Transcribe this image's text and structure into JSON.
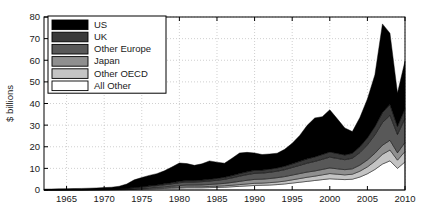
{
  "chart_data": {
    "type": "area",
    "stacked": true,
    "title": "",
    "xlabel": "",
    "ylabel": "$ billions",
    "xlim": [
      1962,
      2010
    ],
    "ylim": [
      0,
      80
    ],
    "yticks": [
      0,
      10,
      20,
      30,
      40,
      50,
      60,
      70,
      80
    ],
    "xticks": [
      1965,
      1970,
      1975,
      1980,
      1985,
      1990,
      1995,
      2000,
      2005,
      2010
    ],
    "grid": true,
    "legend_position": "top-left",
    "x": [
      1962,
      1963,
      1964,
      1965,
      1966,
      1967,
      1968,
      1969,
      1970,
      1971,
      1972,
      1973,
      1974,
      1975,
      1976,
      1977,
      1978,
      1979,
      1980,
      1981,
      1982,
      1983,
      1984,
      1985,
      1986,
      1987,
      1988,
      1989,
      1990,
      1991,
      1992,
      1993,
      1994,
      1995,
      1996,
      1997,
      1998,
      1999,
      2000,
      2001,
      2002,
      2003,
      2004,
      2005,
      2006,
      2007,
      2008,
      2009,
      2010
    ],
    "series": [
      {
        "name": "All Other",
        "color": "#ffffff",
        "values": [
          0.05,
          0.05,
          0.06,
          0.06,
          0.07,
          0.07,
          0.08,
          0.09,
          0.1,
          0.12,
          0.15,
          0.2,
          0.3,
          0.4,
          0.5,
          0.6,
          0.7,
          0.8,
          0.9,
          1.0,
          1.0,
          1.0,
          1.1,
          1.2,
          1.3,
          1.5,
          1.7,
          1.9,
          2.1,
          2.2,
          2.3,
          2.5,
          2.8,
          3.2,
          3.6,
          4.0,
          4.4,
          4.8,
          5.2,
          5.0,
          4.8,
          5.0,
          6.0,
          7.5,
          9.5,
          12.0,
          13.5,
          10.0,
          13.0
        ]
      },
      {
        "name": "Other OECD",
        "color": "#c4c4c4",
        "values": [
          0.02,
          0.02,
          0.02,
          0.03,
          0.03,
          0.03,
          0.04,
          0.04,
          0.05,
          0.06,
          0.08,
          0.1,
          0.15,
          0.2,
          0.25,
          0.3,
          0.35,
          0.4,
          0.45,
          0.5,
          0.5,
          0.5,
          0.55,
          0.6,
          0.65,
          0.7,
          0.8,
          0.9,
          1.0,
          1.0,
          1.1,
          1.2,
          1.3,
          1.5,
          1.7,
          1.9,
          2.0,
          2.2,
          2.4,
          2.3,
          2.2,
          2.3,
          2.7,
          3.2,
          3.8,
          4.5,
          5.0,
          3.8,
          4.8
        ]
      },
      {
        "name": "Japan",
        "color": "#8f8f8f",
        "values": [
          0.01,
          0.01,
          0.01,
          0.02,
          0.02,
          0.02,
          0.03,
          0.03,
          0.04,
          0.05,
          0.07,
          0.1,
          0.15,
          0.2,
          0.3,
          0.35,
          0.45,
          0.55,
          0.7,
          0.8,
          0.8,
          0.85,
          0.9,
          1.0,
          1.1,
          1.3,
          1.5,
          1.7,
          1.8,
          1.8,
          1.9,
          2.0,
          2.1,
          2.2,
          2.3,
          2.4,
          2.4,
          2.5,
          2.6,
          2.5,
          2.4,
          2.5,
          2.8,
          3.2,
          3.7,
          4.2,
          4.5,
          3.4,
          4.2
        ]
      },
      {
        "name": "Other Europe",
        "color": "#585858",
        "values": [
          0.02,
          0.02,
          0.03,
          0.03,
          0.04,
          0.04,
          0.05,
          0.06,
          0.08,
          0.1,
          0.15,
          0.25,
          0.4,
          0.5,
          0.6,
          0.75,
          0.9,
          1.1,
          1.3,
          1.4,
          1.4,
          1.5,
          1.6,
          1.7,
          1.9,
          2.1,
          2.4,
          2.6,
          2.8,
          2.8,
          2.9,
          3.0,
          3.2,
          3.5,
          3.8,
          4.1,
          4.4,
          4.7,
          5.0,
          4.8,
          4.6,
          4.9,
          5.8,
          7.0,
          8.5,
          10.5,
          11.5,
          8.5,
          11.0
        ]
      },
      {
        "name": "UK",
        "color": "#3a3a3a",
        "values": [
          0.01,
          0.01,
          0.01,
          0.02,
          0.02,
          0.02,
          0.03,
          0.03,
          0.04,
          0.05,
          0.07,
          0.12,
          0.2,
          0.25,
          0.3,
          0.35,
          0.45,
          0.55,
          0.65,
          0.7,
          0.7,
          0.75,
          0.8,
          0.85,
          0.95,
          1.05,
          1.2,
          1.3,
          1.4,
          1.4,
          1.45,
          1.5,
          1.6,
          1.7,
          1.85,
          2.0,
          2.1,
          2.2,
          2.4,
          2.3,
          2.2,
          2.3,
          2.7,
          3.2,
          3.8,
          4.6,
          5.0,
          3.7,
          4.6
        ]
      },
      {
        "name": "US",
        "color": "#000000",
        "values": [
          0.3,
          0.35,
          0.4,
          0.45,
          0.5,
          0.55,
          0.6,
          0.7,
          0.8,
          0.9,
          1.2,
          2.0,
          3.5,
          4.2,
          4.8,
          5.2,
          6.0,
          7.2,
          8.5,
          7.8,
          7.0,
          7.5,
          8.5,
          7.5,
          6.5,
          8.0,
          9.5,
          9.0,
          8.0,
          7.2,
          7.0,
          6.8,
          7.8,
          9.5,
          12.0,
          15.5,
          18.0,
          17.5,
          19.5,
          16.0,
          12.5,
          10.0,
          13.5,
          18.0,
          24.0,
          41.0,
          33.0,
          15.5,
          22.0
        ]
      }
    ]
  },
  "legend": {
    "items": [
      {
        "label": "US",
        "color": "#000000"
      },
      {
        "label": "UK",
        "color": "#3a3a3a"
      },
      {
        "label": "Other Europe",
        "color": "#585858"
      },
      {
        "label": "Japan",
        "color": "#8f8f8f"
      },
      {
        "label": "Other OECD",
        "color": "#c4c4c4"
      },
      {
        "label": "All Other",
        "color": "#ffffff"
      }
    ]
  }
}
